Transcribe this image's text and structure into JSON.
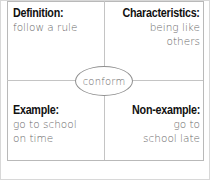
{
  "frayer_model": {
    "center_word": "conform",
    "quadrants": {
      "definition": {
        "heading": "Definition:",
        "lines": [
          "follow a rule"
        ]
      },
      "characteristics": {
        "heading": "Characteristics:",
        "lines": [
          "being like",
          "others"
        ]
      },
      "example": {
        "heading": "Example:",
        "lines": [
          "go to school",
          "on time"
        ]
      },
      "non_example": {
        "heading": "Non-example:",
        "lines": [
          "go to",
          "school late"
        ]
      }
    }
  },
  "colors": {
    "heading": "#111111",
    "body_text": "#6a6a6a",
    "border": "#b9b9b9"
  }
}
